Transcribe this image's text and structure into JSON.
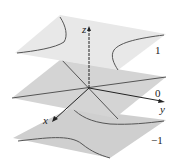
{
  "figure": {
    "axes": {
      "x_label": "x",
      "y_label": "y",
      "z_label": "z"
    },
    "levels": [
      {
        "value": "1",
        "curve": "hyperbola opening along y"
      },
      {
        "value": "0",
        "curve": "pair of crossing lines"
      },
      {
        "value": "−1",
        "curve": "hyperbola opening along x"
      }
    ]
  },
  "colors": {
    "plane_top": "#e6e6e6",
    "plane_mid": "#d2d2d2",
    "plane_bottom": "#cfcfcf",
    "curve": "#555555",
    "axis": "#222222"
  }
}
